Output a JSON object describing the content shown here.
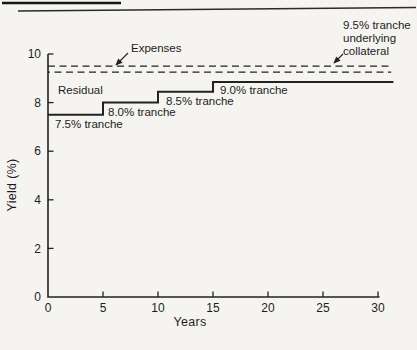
{
  "figure": {
    "background": "#f5f4f1",
    "ink": "#222222"
  },
  "chart_data": {
    "type": "line",
    "title": "",
    "xlabel": "Years",
    "ylabel": "Yield (%)",
    "xlim": [
      0,
      30
    ],
    "ylim": [
      0,
      10
    ],
    "xticks": [
      0,
      5,
      10,
      15,
      20,
      25,
      30
    ],
    "yticks": [
      0,
      2,
      4,
      6,
      8,
      10
    ],
    "grid": false,
    "legend": "none",
    "series": [
      {
        "name": "tranche-yield-step",
        "style": "solid",
        "points": [
          [
            0,
            7.5
          ],
          [
            5,
            7.5
          ],
          [
            5,
            8.0
          ],
          [
            10,
            8.0
          ],
          [
            10,
            8.45
          ],
          [
            15,
            8.45
          ],
          [
            15,
            8.85
          ],
          [
            31.4,
            8.85
          ]
        ]
      },
      {
        "name": "collateral-gross-yield-dashed",
        "style": "dashed",
        "points": [
          [
            0,
            9.5
          ],
          [
            31.2,
            9.5
          ]
        ]
      },
      {
        "name": "collateral-net-of-expenses-dashed",
        "style": "dashed",
        "points": [
          [
            0,
            9.25
          ],
          [
            31.2,
            9.25
          ]
        ]
      }
    ],
    "annotations": {
      "expenses": "Expenses",
      "collateral": "9.5% tranche\nunderlying\ncollateral",
      "residual": "Residual",
      "tranche_75": "7.5% tranche",
      "tranche_80": "8.0% tranche",
      "tranche_85": "8.5% tranche",
      "tranche_90": "9.0% tranche"
    }
  }
}
